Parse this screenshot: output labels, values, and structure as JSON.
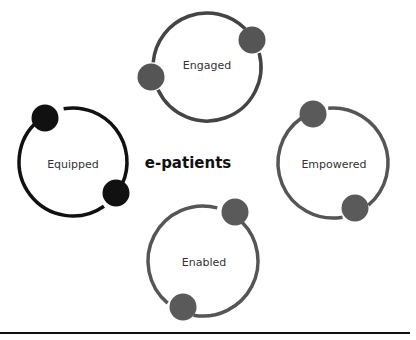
{
  "diagram": {
    "center_label": "e-patients",
    "cycles": [
      {
        "label": "Engaged",
        "cx": 207,
        "cy": 67,
        "r": 54,
        "ring_color": "#444444",
        "dot_color": "#555555",
        "dots": [
          {
            "x": 252,
            "y": 40
          },
          {
            "x": 151,
            "y": 77
          }
        ],
        "gaps": [
          [
            -45,
            -15
          ],
          [
            155,
            185
          ]
        ]
      },
      {
        "label": "Equipped",
        "cx": 73,
        "cy": 162,
        "r": 54,
        "ring_color": "#111111",
        "dot_color": "#111111",
        "dots": [
          {
            "x": 45,
            "y": 118
          },
          {
            "x": 116,
            "y": 193
          }
        ],
        "gaps": [
          [
            -130,
            -100
          ],
          [
            25,
            55
          ]
        ]
      },
      {
        "label": "Empowered",
        "cx": 333,
        "cy": 163,
        "r": 55,
        "ring_color": "#555555",
        "dot_color": "#5a5a5a",
        "dots": [
          {
            "x": 313,
            "y": 114
          },
          {
            "x": 355,
            "y": 208
          }
        ],
        "gaps": [
          [
            -125,
            -95
          ],
          [
            50,
            80
          ]
        ]
      },
      {
        "label": "Enabled",
        "cx": 203,
        "cy": 261,
        "r": 55,
        "ring_color": "#555555",
        "dot_color": "#5a5a5a",
        "dots": [
          {
            "x": 235,
            "y": 212
          },
          {
            "x": 183,
            "y": 307
          }
        ],
        "gaps": [
          [
            -75,
            -45
          ],
          [
            100,
            130
          ]
        ]
      }
    ]
  }
}
